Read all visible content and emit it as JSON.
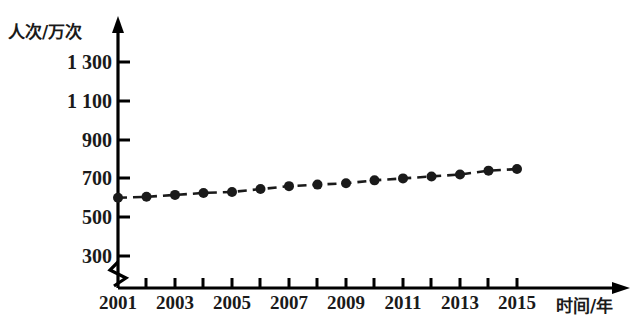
{
  "chart_data": {
    "type": "line",
    "title": "",
    "subtitle": "",
    "xlabel": "时间/年",
    "ylabel": "人次/万次",
    "x": [
      2001,
      2002,
      2003,
      2004,
      2005,
      2006,
      2007,
      2008,
      2009,
      2010,
      2011,
      2012,
      2013,
      2014,
      2015
    ],
    "values": [
      600,
      605,
      615,
      625,
      630,
      645,
      660,
      668,
      675,
      690,
      700,
      710,
      720,
      740,
      748
    ],
    "series": [
      {
        "name": "人次",
        "values": [
          600,
          605,
          615,
          625,
          630,
          645,
          660,
          668,
          675,
          690,
          700,
          710,
          720,
          740,
          748
        ]
      }
    ],
    "xtick_labels": [
      "2001",
      "2003",
      "2005",
      "2007",
      "2009",
      "2011",
      "2013",
      "2015"
    ],
    "xtick_values": [
      2001,
      2003,
      2005,
      2007,
      2009,
      2011,
      2013,
      2015
    ],
    "xminor_ticks": [
      2002,
      2004,
      2006,
      2008,
      2010,
      2012,
      2014
    ],
    "ytick_labels": [
      "300",
      "500",
      "700",
      "900",
      "1 100",
      "1 300"
    ],
    "ytick_values": [
      300,
      500,
      700,
      900,
      1100,
      1300
    ],
    "xlim": [
      2001,
      2015
    ],
    "ylim": [
      220,
      1380
    ],
    "grid": false,
    "legend": false,
    "legend_position": "none",
    "axis_break": {
      "y_axis": true,
      "x_axis": false,
      "note": "zigzag break symbol on vertical axis below lowest tick"
    },
    "marker": "filled-circle",
    "line_style": "dashed",
    "colors": {
      "line": "#1a1a1a",
      "marker": "#1a1a1a",
      "axis": "#000000",
      "background": "#ffffff"
    }
  }
}
